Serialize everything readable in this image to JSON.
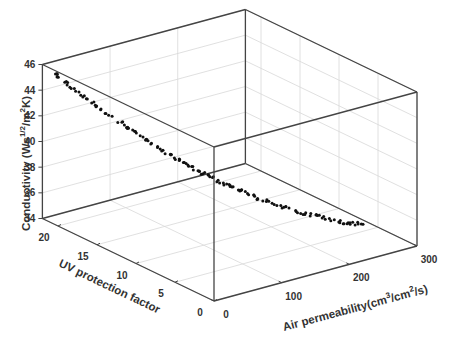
{
  "chart_data": {
    "type": "scatter",
    "subtype": "3d-scatter",
    "title": "",
    "xlabel": "Air permeability(cm3/cm2/s)",
    "ylabel": "UV protection factor",
    "zlabel": "Conductivity (Ws1/2/m2K)",
    "axes": {
      "x": {
        "label_parts": [
          "Air permeability(cm",
          "3",
          "/cm",
          "2",
          "/s)"
        ],
        "range": [
          0,
          300
        ],
        "ticks": [
          0,
          100,
          200,
          300
        ]
      },
      "y": {
        "label": "UV protection factor",
        "range": [
          0,
          22
        ],
        "ticks": [
          0,
          5,
          10,
          15,
          20
        ]
      },
      "z": {
        "label_parts": [
          "Conductivity (Ws",
          "1/2",
          "/m",
          "2",
          "K)"
        ],
        "range": [
          34,
          46
        ],
        "ticks": [
          34,
          36,
          38,
          40,
          42,
          44,
          46
        ]
      }
    },
    "grid": true,
    "legend": null,
    "marker_color": "#111111",
    "series": [
      {
        "name": "data",
        "points_description": "Dense band of ~200 points: conductivity decreases as air permeability rises and UV protection factor falls",
        "key_points": [
          {
            "air_permeability": 5,
            "uv": 21,
            "conductivity": 45.6
          },
          {
            "air_permeability": 20,
            "uv": 19,
            "conductivity": 44.3
          },
          {
            "air_permeability": 40,
            "uv": 17,
            "conductivity": 43.0
          },
          {
            "air_permeability": 60,
            "uv": 15,
            "conductivity": 41.8
          },
          {
            "air_permeability": 80,
            "uv": 13,
            "conductivity": 40.6
          },
          {
            "air_permeability": 100,
            "uv": 11,
            "conductivity": 39.6
          },
          {
            "air_permeability": 120,
            "uv": 9.5,
            "conductivity": 38.8
          },
          {
            "air_permeability": 140,
            "uv": 8,
            "conductivity": 38.1
          },
          {
            "air_permeability": 160,
            "uv": 6.5,
            "conductivity": 37.4
          },
          {
            "air_permeability": 190,
            "uv": 5,
            "conductivity": 36.7
          },
          {
            "air_permeability": 220,
            "uv": 3.5,
            "conductivity": 36.1
          },
          {
            "air_permeability": 250,
            "uv": 2.5,
            "conductivity": 35.6
          }
        ]
      }
    ]
  }
}
